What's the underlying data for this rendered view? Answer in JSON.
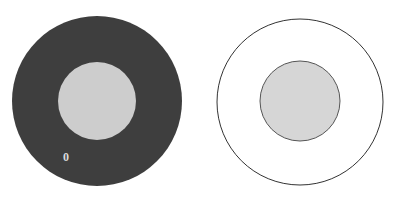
{
  "figure": {
    "background_color": "#ffffff",
    "width": 400,
    "height": 202,
    "panels": [
      {
        "id": "left-panel",
        "name": "filled-annulus",
        "description": "Dark filled disk with light gray concentric inner disk",
        "outer_circle": {
          "name": "outer-circle",
          "center_x": 97,
          "center_y": 101,
          "radius": 85,
          "fill": "#3e3e3e",
          "stroke": "#3e3e3e",
          "stroke_width": 0
        },
        "inner_circle": {
          "name": "inner-circle",
          "center_x": 97,
          "center_y": 101,
          "radius": 39,
          "fill": "#cdcdcd",
          "stroke": "#cdcdcd",
          "stroke_width": 0
        },
        "annotation": {
          "name": "zero-label",
          "text": "0",
          "color": "#d9d9d9",
          "x": 66,
          "y": 157
        }
      },
      {
        "id": "right-panel",
        "name": "outlined-annulus",
        "description": "White outlined circle with light gray concentric inner disk",
        "outer_circle": {
          "name": "outer-circle",
          "center_x": 300,
          "center_y": 102,
          "radius": 83,
          "fill": "#ffffff",
          "stroke": "#333333",
          "stroke_width": 1
        },
        "inner_circle": {
          "name": "inner-circle",
          "center_x": 300,
          "center_y": 101,
          "radius": 40,
          "fill": "#d6d6d6",
          "stroke": "#555555",
          "stroke_width": 1
        },
        "annotation": null
      }
    ],
    "colors": {
      "dark_fill": "#3e3e3e",
      "light_fill": "#cdcdcd",
      "inner_gray": "#d6d6d6",
      "outline": "#333333",
      "inner_outline": "#555555",
      "label": "#d9d9d9",
      "background": "#ffffff"
    }
  }
}
